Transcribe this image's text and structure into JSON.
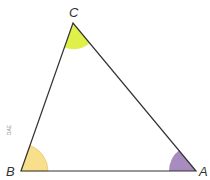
{
  "diagram": {
    "type": "triangle",
    "vertices": [
      {
        "label": "A",
        "x": 196,
        "y": 171
      },
      {
        "label": "B",
        "x": 21,
        "y": 171
      },
      {
        "label": "C",
        "x": 73,
        "y": 23
      }
    ],
    "angle_markers": [
      {
        "vertex": "A",
        "color": "#a98cbf"
      },
      {
        "vertex": "B",
        "color": "#f7df8c"
      },
      {
        "vertex": "C",
        "color": "#dff04a"
      }
    ],
    "side_note": "DAE",
    "line_color": "#333333"
  }
}
